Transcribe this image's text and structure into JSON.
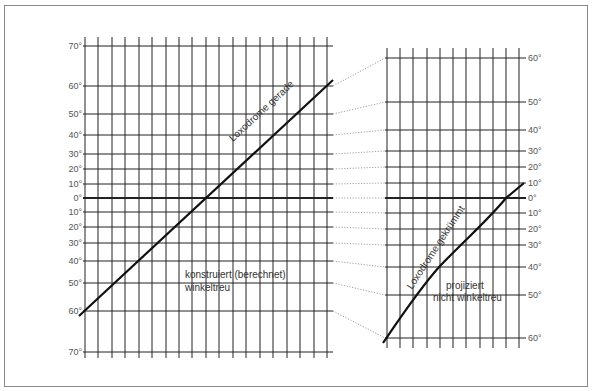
{
  "left_panel": {
    "title": "konstruiert (berechnet)",
    "subtitle": "winkeltreu",
    "line_label": "Loxodrome gerade",
    "x_left": 85,
    "x_right": 333,
    "v_top": 37,
    "v_bottom": 358,
    "v_lines_x": [
      85,
      98,
      112,
      125,
      139,
      152,
      166,
      179,
      192,
      206,
      219,
      233,
      246,
      260,
      273,
      287,
      300,
      314,
      327
    ],
    "latitudes": [
      {
        "label": "70°",
        "y": 46
      },
      {
        "label": "60°",
        "y": 86
      },
      {
        "label": "50°",
        "y": 114
      },
      {
        "label": "40°",
        "y": 135
      },
      {
        "label": "30°",
        "y": 154
      },
      {
        "label": "20°",
        "y": 169
      },
      {
        "label": "10°",
        "y": 184
      },
      {
        "label": "0°",
        "y": 198,
        "equator": true
      },
      {
        "label": "10°",
        "y": 212
      },
      {
        "label": "20°",
        "y": 227
      },
      {
        "label": "30°",
        "y": 243
      },
      {
        "label": "40°",
        "y": 261
      },
      {
        "label": "50°",
        "y": 283
      },
      {
        "label": "60°",
        "y": 311
      },
      {
        "label": "70°",
        "y": 352
      }
    ],
    "line": {
      "x1": 79,
      "y1": 316,
      "x2": 333,
      "y2": 80
    }
  },
  "right_panel": {
    "title": "projiziert",
    "subtitle": "nicht winkeltreu",
    "line_label": "Loxodrome gekrümmt",
    "x_left": 385,
    "x_right": 523,
    "v_top": 48,
    "v_bottom": 348,
    "v_lines_x": [
      387,
      400,
      413,
      427,
      440,
      453,
      466,
      480,
      493,
      506,
      519
    ],
    "latitudes": [
      {
        "label": "60°",
        "y": 58
      },
      {
        "label": "50°",
        "y": 102
      },
      {
        "label": "40°",
        "y": 130
      },
      {
        "label": "30°",
        "y": 151
      },
      {
        "label": "20°",
        "y": 167
      },
      {
        "label": "10°",
        "y": 183
      },
      {
        "label": "0°",
        "y": 198,
        "equator": true
      },
      {
        "label": "10°",
        "y": 213
      },
      {
        "label": "20°",
        "y": 229
      },
      {
        "label": "30°",
        "y": 245
      },
      {
        "label": "40°",
        "y": 267
      },
      {
        "label": "50°",
        "y": 295
      },
      {
        "label": "60°",
        "y": 338
      }
    ],
    "curve": "M383,343 C400,318 420,288 440,266 C465,240 490,218 506,198 L524,183"
  },
  "connectors": [
    {
      "from": [
        333,
        86
      ],
      "to": [
        385,
        58
      ]
    },
    {
      "from": [
        333,
        114
      ],
      "to": [
        385,
        102
      ]
    },
    {
      "from": [
        333,
        135
      ],
      "to": [
        385,
        130
      ]
    },
    {
      "from": [
        333,
        154
      ],
      "to": [
        385,
        151
      ]
    },
    {
      "from": [
        333,
        169
      ],
      "to": [
        385,
        167
      ]
    },
    {
      "from": [
        333,
        184
      ],
      "to": [
        385,
        183
      ]
    },
    {
      "from": [
        333,
        198
      ],
      "to": [
        385,
        198
      ]
    },
    {
      "from": [
        333,
        212
      ],
      "to": [
        385,
        213
      ]
    },
    {
      "from": [
        333,
        227
      ],
      "to": [
        385,
        229
      ]
    },
    {
      "from": [
        333,
        243
      ],
      "to": [
        385,
        245
      ]
    },
    {
      "from": [
        333,
        261
      ],
      "to": [
        385,
        267
      ]
    },
    {
      "from": [
        333,
        283
      ],
      "to": [
        385,
        295
      ]
    },
    {
      "from": [
        333,
        311
      ],
      "to": [
        385,
        338
      ]
    }
  ],
  "colors": {
    "grid": "#222222",
    "line": "#111111",
    "connector": "#888888",
    "frame": "#8a8a8a"
  }
}
